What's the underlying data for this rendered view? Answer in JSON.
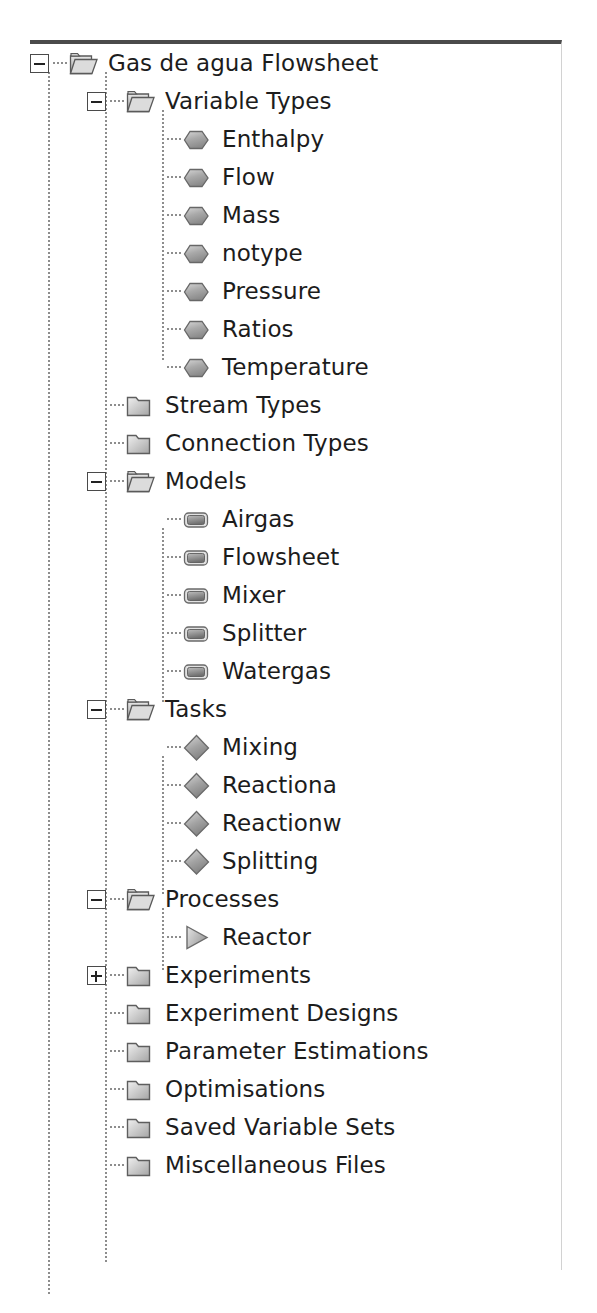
{
  "panel": {
    "name": "flowsheet-project-tree",
    "border_top_color": "#4b4b4b",
    "border_right_color": "#d2d2d2",
    "background": "#ffffff",
    "text_color": "#1c1c1c"
  },
  "icons": {
    "folder_open": "folder-open-icon",
    "folder_closed": "folder-closed-icon",
    "hexagon": "hexagon-icon",
    "rounded_rect": "rounded-rect-icon",
    "diamond": "diamond-icon",
    "triangle": "triangle-play-icon"
  },
  "expanders": {
    "minus": "−",
    "plus": "+"
  },
  "tree": [
    {
      "label": "Gas de agua Flowsheet",
      "depth": 0,
      "icon": "folder_open",
      "expander": "minus"
    },
    {
      "label": "Variable Types",
      "depth": 1,
      "icon": "folder_open",
      "expander": "minus"
    },
    {
      "label": "Enthalpy",
      "depth": 2,
      "icon": "hexagon",
      "expander": "none"
    },
    {
      "label": "Flow",
      "depth": 2,
      "icon": "hexagon",
      "expander": "none"
    },
    {
      "label": "Mass",
      "depth": 2,
      "icon": "hexagon",
      "expander": "none"
    },
    {
      "label": "notype",
      "depth": 2,
      "icon": "hexagon",
      "expander": "none"
    },
    {
      "label": "Pressure",
      "depth": 2,
      "icon": "hexagon",
      "expander": "none"
    },
    {
      "label": "Ratios",
      "depth": 2,
      "icon": "hexagon",
      "expander": "none"
    },
    {
      "label": "Temperature",
      "depth": 2,
      "icon": "hexagon",
      "expander": "none"
    },
    {
      "label": "Stream Types",
      "depth": 1,
      "icon": "folder_closed",
      "expander": "none"
    },
    {
      "label": "Connection Types",
      "depth": 1,
      "icon": "folder_closed",
      "expander": "none"
    },
    {
      "label": "Models",
      "depth": 1,
      "icon": "folder_open",
      "expander": "minus"
    },
    {
      "label": "Airgas",
      "depth": 2,
      "icon": "rounded_rect",
      "expander": "none"
    },
    {
      "label": "Flowsheet",
      "depth": 2,
      "icon": "rounded_rect",
      "expander": "none"
    },
    {
      "label": "Mixer",
      "depth": 2,
      "icon": "rounded_rect",
      "expander": "none"
    },
    {
      "label": "Splitter",
      "depth": 2,
      "icon": "rounded_rect",
      "expander": "none"
    },
    {
      "label": "Watergas",
      "depth": 2,
      "icon": "rounded_rect",
      "expander": "none"
    },
    {
      "label": "Tasks",
      "depth": 1,
      "icon": "folder_open",
      "expander": "minus"
    },
    {
      "label": "Mixing",
      "depth": 2,
      "icon": "diamond",
      "expander": "none"
    },
    {
      "label": "Reactiona",
      "depth": 2,
      "icon": "diamond",
      "expander": "none"
    },
    {
      "label": "Reactionw",
      "depth": 2,
      "icon": "diamond",
      "expander": "none"
    },
    {
      "label": "Splitting",
      "depth": 2,
      "icon": "diamond",
      "expander": "none"
    },
    {
      "label": "Processes",
      "depth": 1,
      "icon": "folder_open",
      "expander": "minus"
    },
    {
      "label": "Reactor",
      "depth": 2,
      "icon": "triangle",
      "expander": "none"
    },
    {
      "label": "Experiments",
      "depth": 1,
      "icon": "folder_closed",
      "expander": "plus"
    },
    {
      "label": "Experiment Designs",
      "depth": 1,
      "icon": "folder_closed",
      "expander": "none"
    },
    {
      "label": "Parameter Estimations",
      "depth": 1,
      "icon": "folder_closed",
      "expander": "none"
    },
    {
      "label": "Optimisations",
      "depth": 1,
      "icon": "folder_closed",
      "expander": "none"
    },
    {
      "label": "Saved Variable Sets",
      "depth": 1,
      "icon": "folder_closed",
      "expander": "none"
    },
    {
      "label": "Miscellaneous Files",
      "depth": 1,
      "icon": "folder_closed",
      "expander": "none"
    }
  ],
  "guides": [
    {
      "name": "guide-root",
      "left": 18,
      "top": 28,
      "height": 1222
    },
    {
      "name": "guide-level1",
      "left": 75,
      "top": 28,
      "height": 1192
    },
    {
      "name": "guide-variable-types",
      "left": 132,
      "top": 66,
      "height": 252
    },
    {
      "name": "guide-models",
      "left": 132,
      "top": 484,
      "height": 176
    },
    {
      "name": "guide-tasks",
      "left": 132,
      "top": 712,
      "height": 138
    },
    {
      "name": "guide-processes",
      "left": 132,
      "top": 864,
      "height": 62
    }
  ]
}
